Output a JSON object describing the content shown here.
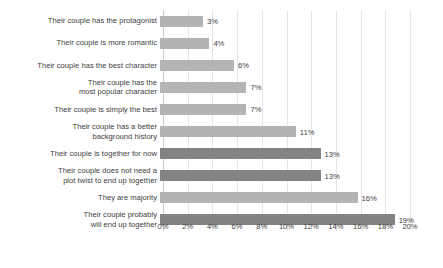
{
  "chart_data": {
    "type": "bar",
    "orientation": "horizontal",
    "title": "",
    "subtitle": "",
    "xlabel": "",
    "ylabel": "",
    "xlim": [
      0,
      20
    ],
    "grid": true,
    "legend": false,
    "value_suffix": "%",
    "tick_labels": [
      "0%",
      "2%",
      "4%",
      "6%",
      "8%",
      "10%",
      "12%",
      "14%",
      "16%",
      "18%",
      "20%"
    ],
    "tick_values": [
      0,
      2,
      4,
      6,
      8,
      10,
      12,
      14,
      16,
      18,
      20
    ],
    "categories": [
      "Their couple has the protagonist",
      "Their couple is more romantic",
      "Their couple has the best character",
      "Their couple has the\nmost popular character",
      "Their couple is simply the best",
      "Their couple has a better\nbackground history",
      "Their couple is together for now",
      "Their couple does not need a\nplot twist to end up together",
      "They are majority",
      "Their couple probably\nwill end up together"
    ],
    "values": [
      3,
      4,
      6,
      7,
      7,
      11,
      13,
      13,
      16,
      19
    ],
    "value_labels": [
      "3%",
      "4%",
      "6%",
      "7%",
      "7%",
      "11%",
      "13%",
      "13%",
      "16%",
      "19%"
    ],
    "bar_shades": [
      "light",
      "light",
      "light",
      "light",
      "light",
      "light",
      "dark",
      "dark",
      "light",
      "dark"
    ],
    "colors": {
      "bar_light": "#b4b4b4",
      "bar_dark": "#838383",
      "gridline": "#e4e4e4",
      "axis": "#c9c9c9",
      "text": "#3d3d3d",
      "background": "#ffffff"
    }
  },
  "caption": ""
}
